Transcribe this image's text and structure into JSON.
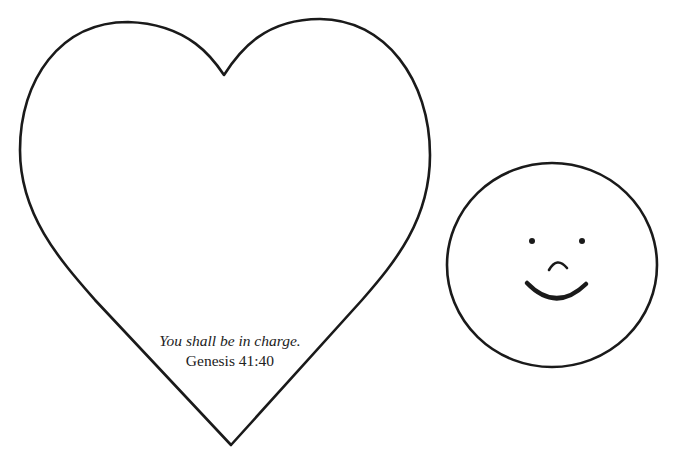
{
  "page": {
    "background": "#ffffff",
    "stroke_color": "#1a1a1a"
  },
  "heart": {
    "shape": "heart-outline",
    "verse": {
      "quote": "You shall be in charge.",
      "reference": "Genesis 41:40"
    }
  },
  "face": {
    "shape": "circle-outline",
    "expression": "smile",
    "features": [
      "left-eye",
      "right-eye",
      "nose-arc",
      "smile-mouth"
    ]
  }
}
